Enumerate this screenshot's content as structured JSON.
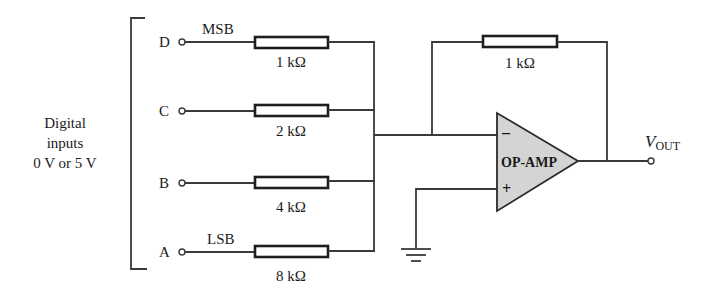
{
  "diagram": {
    "type": "circuit-schematic",
    "inputs_caption": [
      "Digital",
      "inputs",
      "0 V or 5 V"
    ],
    "inputs": [
      {
        "name": "D",
        "bit_label": "MSB",
        "resistor": "1 kΩ"
      },
      {
        "name": "C",
        "bit_label": "",
        "resistor": "2 kΩ"
      },
      {
        "name": "B",
        "bit_label": "",
        "resistor": "4 kΩ"
      },
      {
        "name": "A",
        "bit_label": "LSB",
        "resistor": "8 kΩ"
      }
    ],
    "feedback_resistor": "1 kΩ",
    "opamp": {
      "label": "OP-AMP",
      "inverting_sign": "–",
      "noninverting_sign": "+",
      "fill_color": "#d4d4d4"
    },
    "output": {
      "symbol": "V",
      "subscript": "OUT"
    },
    "ground_symbol": "ground-icon"
  }
}
